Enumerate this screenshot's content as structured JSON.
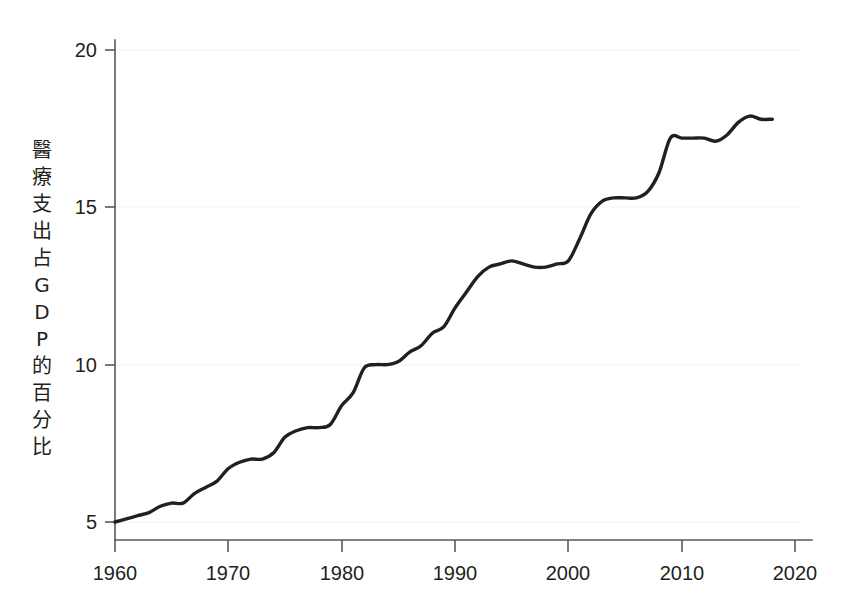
{
  "chart_data": {
    "type": "line",
    "title": "",
    "subtitle": "",
    "xlabel": "",
    "ylabel": "醫療支出占GDP的百分比",
    "ylabel_chars": [
      "醫",
      "療",
      "支",
      "出",
      "占",
      "G",
      "D",
      "P",
      "的",
      "百",
      "分",
      "比"
    ],
    "xlim": [
      1958,
      2021
    ],
    "ylim": [
      4.4,
      20.6
    ],
    "xticks": [
      1960,
      1970,
      1980,
      1990,
      2000,
      2010,
      2020
    ],
    "xtick_labels": [
      "1960",
      "1970",
      "1980",
      "1990",
      "2000",
      "2010",
      "2020"
    ],
    "yticks": [
      5,
      10,
      15,
      20
    ],
    "ytick_labels": [
      "5",
      "10",
      "15",
      "20"
    ],
    "grid": false,
    "legend": "none",
    "line_color": "#231f20",
    "axis_color": "#58595b",
    "background_color": "#ffffff",
    "x": [
      1960,
      1961,
      1962,
      1963,
      1964,
      1965,
      1966,
      1967,
      1968,
      1969,
      1970,
      1971,
      1972,
      1973,
      1974,
      1975,
      1976,
      1977,
      1978,
      1979,
      1980,
      1981,
      1982,
      1983,
      1984,
      1985,
      1986,
      1987,
      1988,
      1989,
      1990,
      1991,
      1992,
      1993,
      1994,
      1995,
      1996,
      1997,
      1998,
      1999,
      2000,
      2001,
      2002,
      2003,
      2004,
      2005,
      2006,
      2007,
      2008,
      2009,
      2010,
      2011,
      2012,
      2013,
      2014,
      2015,
      2016,
      2017,
      2018
    ],
    "y": [
      5.0,
      5.1,
      5.2,
      5.3,
      5.5,
      5.6,
      5.6,
      5.9,
      6.1,
      6.3,
      6.7,
      6.9,
      7.0,
      7.0,
      7.2,
      7.7,
      7.9,
      8.0,
      8.0,
      8.1,
      8.7,
      9.1,
      9.9,
      10.0,
      10.0,
      10.1,
      10.4,
      10.6,
      11.0,
      11.2,
      11.8,
      12.3,
      12.8,
      13.1,
      13.2,
      13.3,
      13.2,
      13.1,
      13.1,
      13.2,
      13.3,
      14.0,
      14.8,
      15.2,
      15.3,
      15.3,
      15.3,
      15.5,
      16.1,
      17.2,
      17.2,
      17.2,
      17.2,
      17.1,
      17.3,
      17.7,
      17.9,
      17.8,
      17.8
    ]
  },
  "axis": {
    "y_tick_5": "5",
    "y_tick_10": "10",
    "y_tick_15": "15",
    "y_tick_20": "20",
    "x_tick_1960": "1960",
    "x_tick_1970": "1970",
    "x_tick_1980": "1980",
    "x_tick_1990": "1990",
    "x_tick_2000": "2000",
    "x_tick_2010": "2010",
    "x_tick_2020": "2020"
  },
  "ylabel_stack": {
    "c0": "醫",
    "c1": "療",
    "c2": "支",
    "c3": "出",
    "c4": "占",
    "c5": "G",
    "c6": "D",
    "c7": "P",
    "c8": "的",
    "c9": "百",
    "c10": "分",
    "c11": "比"
  }
}
